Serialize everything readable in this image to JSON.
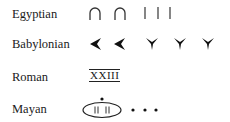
{
  "rows": [
    {
      "label": "Egyptian",
      "symbols": [
        "heel-bone-ten",
        "heel-bone-ten",
        "stroke-one",
        "stroke-one",
        "stroke-one"
      ]
    },
    {
      "label": "Babylonian",
      "symbols": [
        "wedge-ten",
        "wedge-ten",
        "wedge-one",
        "wedge-one",
        "wedge-one"
      ]
    },
    {
      "label": "Roman",
      "numeral": "XXIII"
    },
    {
      "label": "Mayan",
      "symbols": [
        "shell-zero-with-bars",
        "dot",
        "dot",
        "dot"
      ]
    }
  ]
}
